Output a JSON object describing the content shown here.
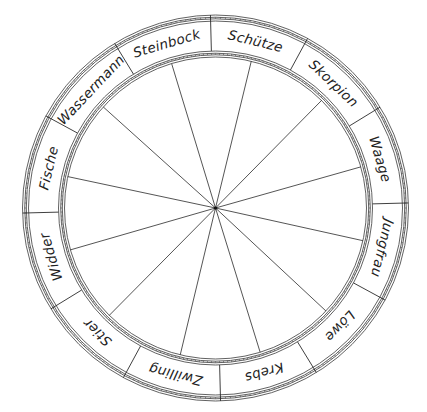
{
  "diagram": {
    "type": "zodiac-wheel",
    "center": [
      215.5,
      208
    ],
    "radii": {
      "outer_ring_outer": 193,
      "outer_ring_inner": 187,
      "label_text": 172,
      "inner_ring_outer": 157,
      "inner_ring_inner": 151
    },
    "divider_start_angle_deg": -91.5,
    "signs": [
      {
        "name": "Steinbock",
        "angle": -106.5
      },
      {
        "name": "Schütze",
        "angle": -76.5
      },
      {
        "name": "Skorpion",
        "angle": -46.5
      },
      {
        "name": "Waage",
        "angle": -16.5
      },
      {
        "name": "Jungfrau",
        "angle": 13.5
      },
      {
        "name": "Löwe",
        "angle": 43.5
      },
      {
        "name": "Krebs",
        "angle": 73.5
      },
      {
        "name": "Zwilling",
        "angle": 103.5
      },
      {
        "name": "Stier",
        "angle": 133.5
      },
      {
        "name": "Widder",
        "angle": 163.5
      },
      {
        "name": "Fische",
        "angle": 193.5
      },
      {
        "name": "Wassermann",
        "angle": 223.5
      }
    ],
    "spoke_angles_deg": [
      -106.9,
      -76.3,
      -45.4,
      -15.8,
      12.5,
      43.0,
      72.8,
      103.5,
      134.7,
      163.9,
      192.0,
      222.0
    ],
    "colors": {
      "line": "#2a2a2a",
      "text": "#222222",
      "background": "#ffffff"
    }
  }
}
